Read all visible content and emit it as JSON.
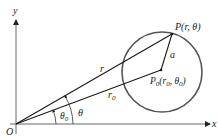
{
  "diagram": {
    "axes": {
      "x_label": "x",
      "y_label": "y",
      "origin_label": "O"
    },
    "points": {
      "P": {
        "label": "P(r,  θ)"
      },
      "P0": {
        "label_main": "P",
        "label_sub": "0",
        "label_rest": "(r",
        "label_sub2": "0",
        "label_rest2": ", θ",
        "label_sub3": "0",
        "label_end": ")"
      }
    },
    "segments": {
      "r_label": "r",
      "r0_label_main": "r",
      "r0_label_sub": "0",
      "a_label": "a"
    },
    "angles": {
      "theta_label": "θ",
      "theta0_label_main": "θ",
      "theta0_label_sub": "0"
    },
    "colors": {
      "lines": "#1a1a1a",
      "circle": "#555555",
      "axes": "#666666",
      "background": "#ffffff"
    }
  }
}
